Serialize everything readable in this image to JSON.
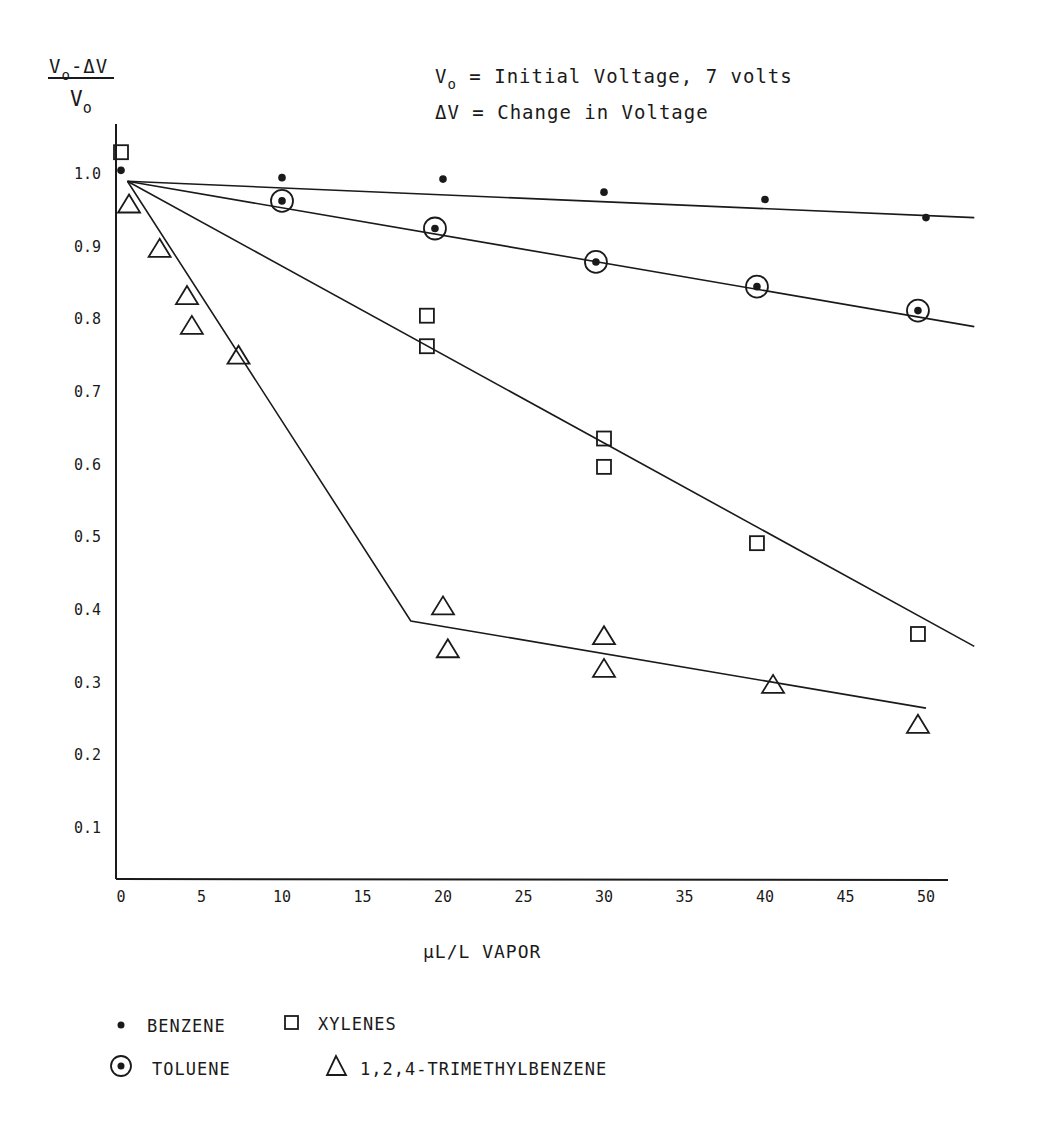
{
  "chart_data": {
    "type": "scatter",
    "title": "",
    "ylabel": "(Vo - ΔV) / Vo",
    "ylabel_parts": {
      "numerator": "V",
      "numerator_sub": "o",
      "numerator_rest": "-ΔV",
      "denominator": "V",
      "denominator_sub": "o"
    },
    "xlabel": "μL/L VAPOR",
    "annotations": [
      {
        "main": "V",
        "sub": "o",
        "rest": " = Initial Voltage, 7 volts"
      },
      {
        "main": "ΔV",
        "sub": "",
        "rest": " = Change in Voltage"
      }
    ],
    "xlim": [
      0,
      53
    ],
    "ylim": [
      0.03,
      1.07
    ],
    "grid": false,
    "legend_position": "bottom",
    "x_ticks": [
      "0",
      "5",
      "10",
      "15",
      "20",
      "25",
      "30",
      "35",
      "40",
      "45",
      "50"
    ],
    "x_tick_values": [
      0,
      5,
      10,
      15,
      20,
      25,
      30,
      35,
      40,
      45,
      50
    ],
    "y_ticks": [
      "1.0",
      "0.9",
      "0.8",
      "0.7",
      "0.6",
      "0.5",
      "0.4",
      "0.3",
      "0.2",
      "0.1"
    ],
    "y_tick_values": [
      1.0,
      0.9,
      0.8,
      0.7,
      0.6,
      0.5,
      0.4,
      0.3,
      0.2,
      0.1
    ],
    "series": [
      {
        "name": "BENZENE",
        "marker": "dot",
        "points": [
          [
            0,
            1.005
          ],
          [
            10,
            0.995
          ],
          [
            20,
            0.993
          ],
          [
            30,
            0.975
          ],
          [
            40,
            0.965
          ],
          [
            50,
            0.94
          ]
        ],
        "fit_line": [
          [
            0.4,
            0.99
          ],
          [
            53,
            0.94
          ]
        ]
      },
      {
        "name": "TOLUENE",
        "marker": "circled-dot",
        "points": [
          [
            10,
            0.963
          ],
          [
            19.5,
            0.925
          ],
          [
            29.5,
            0.879
          ],
          [
            39.5,
            0.845
          ],
          [
            49.5,
            0.812
          ]
        ],
        "fit_line": [
          [
            0.4,
            0.99
          ],
          [
            53,
            0.79
          ]
        ]
      },
      {
        "name": "XYLENES",
        "marker": "square",
        "points": [
          [
            0,
            1.03
          ],
          [
            19,
            0.805
          ],
          [
            19,
            0.763
          ],
          [
            30,
            0.636
          ],
          [
            30,
            0.597
          ],
          [
            39.5,
            0.492
          ],
          [
            49.5,
            0.367
          ]
        ],
        "fit_line": [
          [
            0.4,
            0.99
          ],
          [
            53,
            0.35
          ]
        ]
      },
      {
        "name": "1,2,4-TRIMETHYLBENZENE",
        "marker": "triangle",
        "points": [
          [
            0.5,
            0.958
          ],
          [
            2.4,
            0.897
          ],
          [
            4.1,
            0.832
          ],
          [
            4.4,
            0.791
          ],
          [
            7.3,
            0.75
          ],
          [
            20,
            0.405
          ],
          [
            20.3,
            0.346
          ],
          [
            30,
            0.364
          ],
          [
            30,
            0.319
          ],
          [
            40.5,
            0.297
          ],
          [
            49.5,
            0.242
          ]
        ],
        "fit_line": [
          [
            0.4,
            0.99
          ],
          [
            18,
            0.385
          ],
          [
            50,
            0.265
          ]
        ]
      }
    ],
    "legend": [
      {
        "label": "BENZENE",
        "marker": "dot"
      },
      {
        "label": "XYLENES",
        "marker": "square"
      },
      {
        "label": "TOLUENE",
        "marker": "circled-dot"
      },
      {
        "label": "1,2,4-TRIMETHYLBENZENE",
        "marker": "triangle"
      }
    ]
  },
  "colors": {
    "ink": "#1a1a1a",
    "background": "#ffffff"
  }
}
